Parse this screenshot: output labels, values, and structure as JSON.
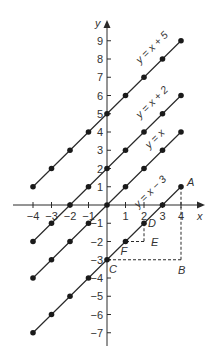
{
  "chart_data": {
    "type": "line",
    "title": "",
    "xlabel": "x",
    "ylabel": "y",
    "xlim": [
      -4,
      4
    ],
    "ylim": [
      -7,
      9
    ],
    "grid": false,
    "x_ticks": [
      -4,
      -3,
      -2,
      -1,
      1,
      2,
      3,
      4
    ],
    "x_tick_labels": [
      "−4",
      "−3",
      "−2",
      "−1",
      "1",
      "2",
      "3",
      "4"
    ],
    "y_ticks": [
      9,
      8,
      7,
      6,
      5,
      4,
      3,
      2,
      1,
      -1,
      -2,
      -3,
      -4,
      -5,
      -6,
      -7
    ],
    "y_tick_labels": [
      "9",
      "8",
      "7",
      "6",
      "5",
      "4",
      "3",
      "2",
      "1",
      "−1",
      "−2",
      "−3",
      "−4",
      "−5",
      "−6",
      "−7"
    ],
    "x": [
      -4,
      -3,
      -2,
      -1,
      0,
      1,
      2,
      3,
      4
    ],
    "series": [
      {
        "name": "y = x + 5",
        "values": [
          1,
          2,
          3,
          4,
          5,
          6,
          7,
          8,
          9
        ]
      },
      {
        "name": "y = x + 2",
        "values": [
          -2,
          -1,
          0,
          1,
          2,
          3,
          4,
          5,
          6
        ]
      },
      {
        "name": "y = x",
        "values": [
          -4,
          -3,
          -2,
          -1,
          0,
          1,
          2,
          3,
          4
        ]
      },
      {
        "name": "y = x − 3",
        "values": [
          -7,
          -6,
          -5,
          -4,
          -3,
          -2,
          -1,
          0,
          1
        ]
      }
    ],
    "annotations": [
      {
        "label": "A",
        "x": 4,
        "y": 1
      },
      {
        "label": "B",
        "x": 4,
        "y": -3
      },
      {
        "label": "C",
        "x": 0,
        "y": -3
      },
      {
        "label": "D",
        "x": 2,
        "y": -1
      },
      {
        "label": "E",
        "x": 2,
        "y": -2
      },
      {
        "label": "F",
        "x": 1,
        "y": -2
      }
    ],
    "dashed_segments": [
      {
        "from": [
          4,
          1
        ],
        "to": [
          4,
          -3
        ]
      },
      {
        "from": [
          4,
          -3
        ],
        "to": [
          0,
          -3
        ]
      },
      {
        "from": [
          2,
          -1
        ],
        "to": [
          2,
          -2
        ]
      },
      {
        "from": [
          2,
          -2
        ],
        "to": [
          1,
          -2
        ]
      }
    ]
  }
}
